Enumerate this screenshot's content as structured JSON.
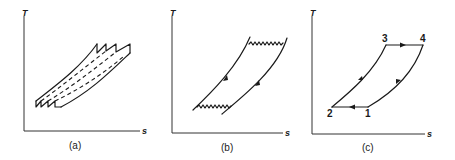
{
  "figure": {
    "panels": [
      {
        "id": "a",
        "caption": "(a)",
        "y_axis_label": "T",
        "x_axis_label": "s",
        "description": "Multi-stage regenerative cycle with staircase heat exchange approximating isotherms"
      },
      {
        "id": "b",
        "caption": "(b)",
        "y_axis_label": "T",
        "x_axis_label": "s",
        "description": "Ericsson-type cycle with isothermal heat transfer (wavy lines) and parallel regenerative curves"
      },
      {
        "id": "c",
        "caption": "(c)",
        "y_axis_label": "T",
        "x_axis_label": "s",
        "description": "Idealized cycle 1-2-3-4 on T-s diagram",
        "points": [
          {
            "label": "1"
          },
          {
            "label": "2"
          },
          {
            "label": "3"
          },
          {
            "label": "4"
          }
        ]
      }
    ]
  }
}
